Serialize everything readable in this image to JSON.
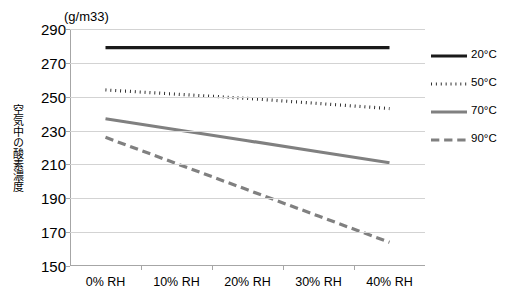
{
  "chart_data": {
    "type": "line",
    "title": "",
    "subtitle": "",
    "unit_label": "(g/m33)",
    "xlabel": "",
    "ylabel": "空気中の酸素濃度",
    "categories": [
      "0% RH",
      "10% RH",
      "20% RH",
      "30% RH",
      "40% RH"
    ],
    "ylim": [
      150,
      290
    ],
    "yticks": [
      150,
      170,
      190,
      210,
      230,
      250,
      270,
      290
    ],
    "grid": true,
    "legend_position": "right",
    "series": [
      {
        "name": "20°C",
        "label": "20°C",
        "style": "solid",
        "color": "#1a1a1a",
        "width": 3.2,
        "values": [
          279,
          279,
          279,
          279,
          279
        ]
      },
      {
        "name": "50°C",
        "label": "50°C",
        "style": "dotted",
        "color": "#1a1a1a",
        "width": 3.2,
        "values": [
          254,
          251.5,
          249,
          246,
          243
        ]
      },
      {
        "name": "70°C",
        "label": "70°C",
        "style": "solid",
        "color": "#808080",
        "width": 3.2,
        "values": [
          237,
          230.5,
          224,
          217.5,
          211
        ]
      },
      {
        "name": "90°C",
        "label": "90°C",
        "style": "dashed",
        "color": "#808080",
        "width": 3.2,
        "values": [
          226,
          210.5,
          195,
          179.5,
          164
        ]
      }
    ]
  },
  "legend": {
    "items": [
      {
        "label": "20°C"
      },
      {
        "label": "50°C"
      },
      {
        "label": "70°C"
      },
      {
        "label": "90°C"
      }
    ]
  }
}
